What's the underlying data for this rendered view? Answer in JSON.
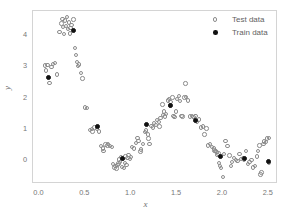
{
  "chart_data": {
    "type": "scatter",
    "title": "",
    "xlabel": "x",
    "ylabel": "y",
    "xlim": [
      -0.07,
      2.6
    ],
    "xticks": [
      "0.0",
      "0.5",
      "1.0",
      "1.5",
      "2.0",
      "2.5"
    ],
    "xtick_values": [
      0.0,
      0.5,
      1.0,
      1.5,
      2.0,
      2.5
    ],
    "ylim": [
      -0.75,
      4.75
    ],
    "yticks": [
      "0",
      "1",
      "2",
      "3",
      "4"
    ],
    "ytick_values": [
      0,
      1,
      2,
      3,
      4
    ],
    "grid": false,
    "legend_position": "top-right",
    "series": [
      {
        "name": "Test data",
        "marker": "open-circle",
        "color": "#8c8c8c",
        "points": [
          [
            0.06,
            3.02
          ],
          [
            0.07,
            2.86
          ],
          [
            0.09,
            3.04
          ],
          [
            0.11,
            2.47
          ],
          [
            0.13,
            2.96
          ],
          [
            0.15,
            3.07
          ],
          [
            0.17,
            3.1
          ],
          [
            0.19,
            2.73
          ],
          [
            0.22,
            4.08
          ],
          [
            0.24,
            4.35
          ],
          [
            0.25,
            4.5
          ],
          [
            0.26,
            4.24
          ],
          [
            0.27,
            4.02
          ],
          [
            0.28,
            4.45
          ],
          [
            0.29,
            4.28
          ],
          [
            0.3,
            4.55
          ],
          [
            0.31,
            4.17
          ],
          [
            0.32,
            4.38
          ],
          [
            0.33,
            4.03
          ],
          [
            0.34,
            4.21
          ],
          [
            0.35,
            4.3
          ],
          [
            0.37,
            4.48
          ],
          [
            0.39,
            3.58
          ],
          [
            0.4,
            3.36
          ],
          [
            0.41,
            3.12
          ],
          [
            0.42,
            3.0
          ],
          [
            0.43,
            3.05
          ],
          [
            0.45,
            2.78
          ],
          [
            0.47,
            2.6
          ],
          [
            0.5,
            1.68
          ],
          [
            0.52,
            1.67
          ],
          [
            0.55,
            0.96
          ],
          [
            0.57,
            1.0
          ],
          [
            0.58,
            0.92
          ],
          [
            0.6,
            1.05
          ],
          [
            0.63,
            1.02
          ],
          [
            0.65,
            0.92
          ],
          [
            0.67,
            0.46
          ],
          [
            0.69,
            0.38
          ],
          [
            0.7,
            0.3
          ],
          [
            0.72,
            0.5
          ],
          [
            0.74,
            0.47
          ],
          [
            0.75,
            0.52
          ],
          [
            0.77,
            0.46
          ],
          [
            0.79,
            0.42
          ],
          [
            0.8,
            -0.12
          ],
          [
            0.82,
            -0.23
          ],
          [
            0.83,
            -0.18
          ],
          [
            0.84,
            -0.26
          ],
          [
            0.85,
            -0.15
          ],
          [
            0.86,
            -0.1
          ],
          [
            0.87,
            0.03
          ],
          [
            0.88,
            -0.05
          ],
          [
            0.89,
            0.1
          ],
          [
            0.9,
            -0.2
          ],
          [
            0.91,
            0.05
          ],
          [
            0.92,
            -0.25
          ],
          [
            0.93,
            -0.08
          ],
          [
            0.94,
            0.12
          ],
          [
            0.95,
            -0.14
          ],
          [
            0.96,
            0.08
          ],
          [
            0.97,
            0.18
          ],
          [
            0.99,
            0.05
          ],
          [
            1.0,
            0.1
          ],
          [
            1.01,
            0.42
          ],
          [
            1.03,
            0.38
          ],
          [
            1.05,
            0.55
          ],
          [
            1.07,
            0.72
          ],
          [
            1.08,
            0.62
          ],
          [
            1.1,
            0.28
          ],
          [
            1.11,
            0.35
          ],
          [
            1.13,
            0.53
          ],
          [
            1.15,
            0.9
          ],
          [
            1.16,
            0.95
          ],
          [
            1.18,
            0.82
          ],
          [
            1.19,
            0.7
          ],
          [
            1.2,
            0.52
          ],
          [
            1.22,
            1.1
          ],
          [
            1.24,
            1.05
          ],
          [
            1.25,
            1.18
          ],
          [
            1.27,
            1.12
          ],
          [
            1.28,
            1.28
          ],
          [
            1.3,
            1.22
          ],
          [
            1.31,
            1.08
          ],
          [
            1.32,
            1.35
          ],
          [
            1.34,
            1.78
          ],
          [
            1.35,
            1.45
          ],
          [
            1.36,
            1.55
          ],
          [
            1.37,
            1.4
          ],
          [
            1.38,
            1.48
          ],
          [
            1.4,
            1.9
          ],
          [
            1.41,
            1.96
          ],
          [
            1.42,
            1.75
          ],
          [
            1.43,
            1.85
          ],
          [
            1.45,
            2.0
          ],
          [
            1.46,
            1.42
          ],
          [
            1.47,
            1.38
          ],
          [
            1.49,
            1.55
          ],
          [
            1.5,
            1.95
          ],
          [
            1.52,
            2.05
          ],
          [
            1.53,
            1.88
          ],
          [
            1.55,
            1.42
          ],
          [
            1.56,
            1.4
          ],
          [
            1.58,
            2.0
          ],
          [
            1.59,
            2.44
          ],
          [
            1.6,
            2.02
          ],
          [
            1.62,
            1.9
          ],
          [
            1.64,
            1.4
          ],
          [
            1.66,
            1.42
          ],
          [
            1.68,
            1.38
          ],
          [
            1.7,
            1.42
          ],
          [
            1.72,
            1.22
          ],
          [
            1.74,
            1.3
          ],
          [
            1.76,
            1.05
          ],
          [
            1.78,
            1.08
          ],
          [
            1.8,
            0.82
          ],
          [
            1.82,
            1.02
          ],
          [
            1.84,
            0.48
          ],
          [
            1.86,
            0.52
          ],
          [
            1.88,
            0.42
          ],
          [
            1.9,
            0.38
          ],
          [
            1.91,
            0.32
          ],
          [
            1.92,
            0.3
          ],
          [
            1.93,
            0.26
          ],
          [
            1.94,
            0.18
          ],
          [
            1.95,
            0.22
          ],
          [
            1.96,
            -0.08
          ],
          [
            1.97,
            -0.18
          ],
          [
            1.98,
            -0.25
          ],
          [
            2.0,
            -0.52
          ],
          [
            2.01,
            0.2
          ],
          [
            2.03,
            0.62
          ],
          [
            2.05,
            0.45
          ],
          [
            2.07,
            0.15
          ],
          [
            2.09,
            -0.18
          ],
          [
            2.1,
            -0.05
          ],
          [
            2.12,
            0.08
          ],
          [
            2.14,
            0.02
          ],
          [
            2.16,
            -0.02
          ],
          [
            2.18,
            0.2
          ],
          [
            2.2,
            0.05
          ],
          [
            2.22,
            0.08
          ],
          [
            2.23,
            0.02
          ],
          [
            2.25,
            0.3
          ],
          [
            2.27,
            -0.12
          ],
          [
            2.29,
            -0.05
          ],
          [
            2.31,
            0.02
          ],
          [
            2.33,
            -0.22
          ],
          [
            2.35,
            -0.18
          ],
          [
            2.37,
            0.12
          ],
          [
            2.38,
            0.3
          ],
          [
            2.4,
            0.48
          ],
          [
            2.41,
            -0.45
          ],
          [
            2.42,
            -0.38
          ],
          [
            2.44,
            0.52
          ],
          [
            2.45,
            0.6
          ],
          [
            2.47,
            0.58
          ],
          [
            2.48,
            0.7
          ],
          [
            2.5,
            -0.08
          ],
          [
            2.5,
            0.72
          ]
        ]
      },
      {
        "name": "Train data",
        "marker": "filled-circle",
        "color": "#111111",
        "points": [
          [
            0.1,
            2.62
          ],
          [
            0.37,
            4.12
          ],
          [
            0.63,
            1.07
          ],
          [
            0.9,
            0.05
          ],
          [
            1.17,
            1.14
          ],
          [
            1.43,
            1.75
          ],
          [
            1.7,
            1.26
          ],
          [
            1.97,
            0.11
          ],
          [
            2.24,
            0.05
          ],
          [
            2.5,
            -0.05
          ]
        ]
      }
    ]
  },
  "legend": {
    "entries": [
      {
        "label": "Test data",
        "marker": "open-circle"
      },
      {
        "label": "Train data",
        "marker": "filled-circle"
      }
    ]
  },
  "axes": {
    "x_label": "x",
    "y_label": "y"
  }
}
